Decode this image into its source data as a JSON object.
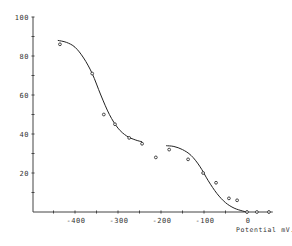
{
  "chart_data": {
    "type": "scatter",
    "title": "",
    "xlabel": "Potential mV.",
    "ylabel": "",
    "xlim": [
      -500,
      60
    ],
    "ylim": [
      0,
      100
    ],
    "grid": false,
    "legend": null,
    "x_ticks": [
      -400,
      -300,
      -200,
      -100,
      0
    ],
    "x_tick_labels": [
      "-400",
      "-300",
      "-200",
      "-100",
      "0"
    ],
    "x_minor_ticks": [
      -450,
      -350,
      -250,
      -150,
      -50,
      50
    ],
    "y_ticks": [
      20,
      40,
      60,
      80,
      100
    ],
    "y_tick_labels": [
      "20",
      "40",
      "60",
      "80",
      "100"
    ],
    "y_minor_ticks": [
      10,
      30,
      50,
      70,
      90
    ],
    "series": [
      {
        "name": "observed points",
        "kind": "scatter",
        "marker": "circle",
        "x": [
          -435,
          -360,
          -333,
          -307,
          -274,
          -244,
          -212,
          -181,
          -137,
          -102,
          -72,
          -42,
          -23,
          0,
          23,
          51
        ],
        "y": [
          86,
          71,
          50,
          45,
          38,
          35,
          28,
          32,
          27,
          20,
          15,
          7,
          6,
          0,
          0,
          0
        ]
      },
      {
        "name": "fitted curve 1",
        "kind": "line",
        "x": [
          -440,
          -420,
          -400,
          -380,
          -360,
          -340,
          -320,
          -300,
          -280,
          -260,
          -244
        ],
        "y": [
          88,
          87,
          84.5,
          79,
          71,
          60,
          50,
          43,
          39,
          37,
          36
        ]
      },
      {
        "name": "fitted curve 2",
        "kind": "line",
        "x": [
          -188,
          -170,
          -150,
          -130,
          -110,
          -90,
          -70,
          -50,
          -30,
          -10,
          0
        ],
        "y": [
          34,
          33.6,
          32,
          29,
          23.5,
          16,
          9.5,
          4.8,
          2,
          0.5,
          0
        ]
      }
    ]
  }
}
